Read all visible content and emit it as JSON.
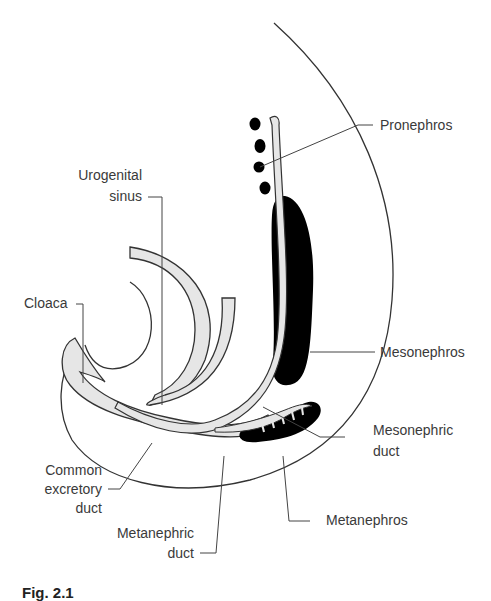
{
  "figure": {
    "caption": "Fig. 2.1",
    "colors": {
      "outline": "#333333",
      "duct_fill": "#e6e6e6",
      "tissue_fill": "#000000",
      "leader_line": "#444444",
      "label_text": "#3a3a3a"
    }
  },
  "labels": {
    "pronephros": "Pronephros",
    "urogenital_sinus_line1": "Urogenital",
    "urogenital_sinus_line2": "sinus",
    "cloaca": "Cloaca",
    "mesonephros": "Mesonephros",
    "mesonephric_duct_line1": "Mesonephric",
    "mesonephric_duct_line2": "duct",
    "common_excretory_duct_line1": "Common",
    "common_excretory_duct_line2": "excretory",
    "common_excretory_duct_line3": "duct",
    "metanephros": "Metanephros",
    "metanephric_duct_line1": "Metanephric",
    "metanephric_duct_line2": "duct"
  }
}
